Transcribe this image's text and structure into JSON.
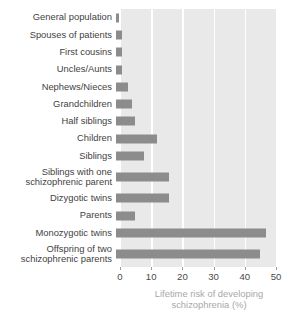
{
  "chart_data": {
    "type": "bar",
    "orientation": "horizontal",
    "title": "",
    "xlabel": "Lifetime risk of developing\nschizophrenia (%)",
    "ylabel": "",
    "xlim": [
      0,
      50
    ],
    "xticks": [
      0,
      10,
      20,
      30,
      40,
      50
    ],
    "xtick_labels": [
      "0",
      "10",
      "20",
      "30",
      "40",
      "50"
    ],
    "grid": "vertical-white",
    "legend": "none",
    "categories": [
      "General population",
      "Spouses of patients",
      "First cousins",
      "Uncles/Aunts",
      "Nephews/Nieces",
      "Grandchildren",
      "Half siblings",
      "Children",
      "Siblings",
      "Siblings with one\nschizophrenic parent",
      "Dizygotic twins",
      "Parents",
      "Monozygotic twins",
      "Offspring of two\nschizophrenic parents"
    ],
    "values": [
      1,
      2,
      2,
      2,
      4,
      5,
      6,
      13,
      9,
      17,
      17,
      6,
      48,
      46
    ],
    "bar_color": "#8c8c8c",
    "plot_background": "#e9e9e9",
    "gridline_color": "#ffffff",
    "axis_title_color": "#a8a8a8",
    "label_color": "#3f3f3f"
  }
}
